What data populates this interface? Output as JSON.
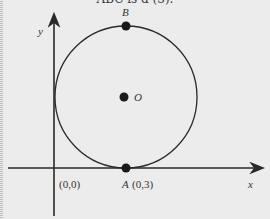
{
  "header_fragment": "ABC is d (3).",
  "axes": {
    "x_label": "x",
    "y_label": "y",
    "origin_label": "(0,0)"
  },
  "points": [
    {
      "name": "B",
      "label": "B"
    },
    {
      "name": "O",
      "label": "O"
    },
    {
      "name": "A",
      "label": "A",
      "coords": "(0,3)"
    }
  ],
  "colors": {
    "ink": "#2a2a2a",
    "background": "#ececec"
  }
}
